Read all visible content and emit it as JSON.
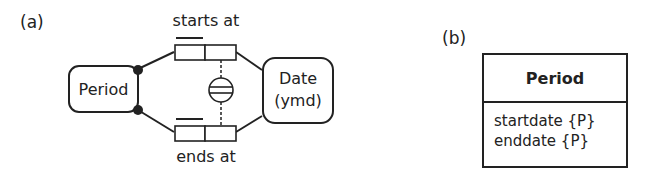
{
  "panel_a": {
    "label": "(a)",
    "entities": {
      "period": "Period",
      "date_line1": "Date",
      "date_line2": "(ymd)"
    },
    "fact_types": {
      "top_reading": "starts at",
      "bottom_reading": "ends at"
    },
    "constraint": "equality-constraint"
  },
  "panel_b": {
    "label": "(b)",
    "class_name": "Period",
    "attributes": [
      "startdate {P}",
      "enddate {P}"
    ]
  },
  "colors": {
    "stroke": "#222222",
    "background": "#ffffff"
  }
}
